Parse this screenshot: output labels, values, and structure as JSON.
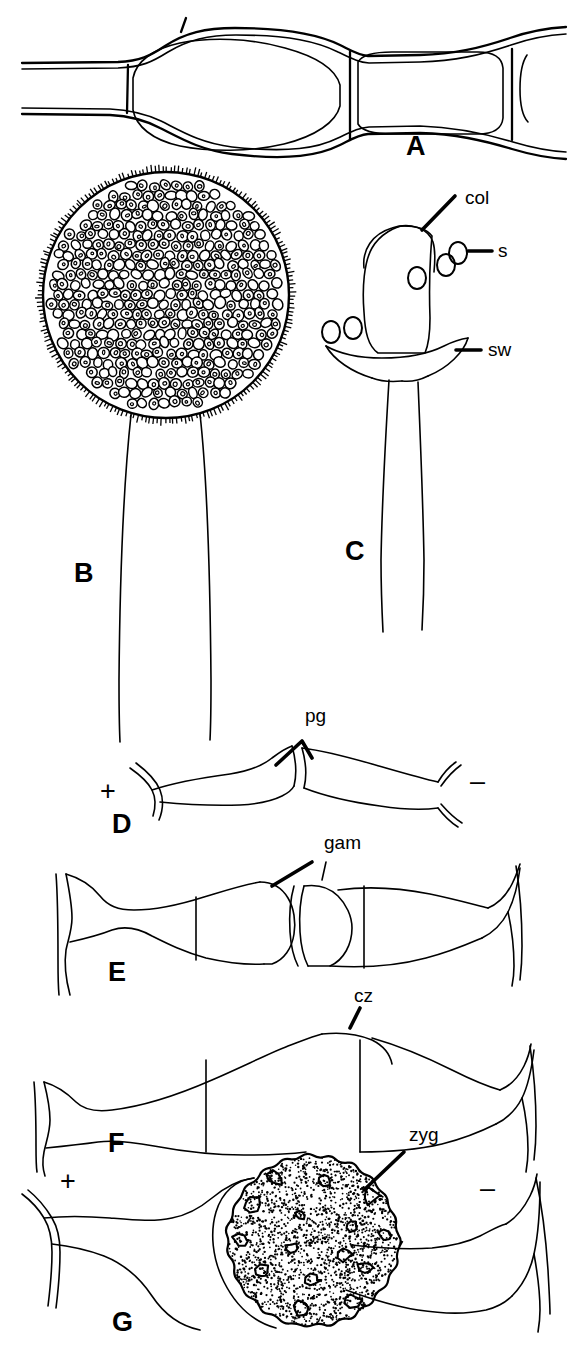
{
  "figure": {
    "background_color": "#ffffff",
    "ink_color": "#000000",
    "width": 576,
    "height": 1359
  },
  "panels": [
    {
      "id": "A",
      "letter": "A",
      "name": "hypha-with-septa",
      "letter_x": 406,
      "letter_y": 155,
      "caption_icon": "hypha-icon"
    },
    {
      "id": "B",
      "letter": "B",
      "name": "sporangium-with-spores",
      "letter_x": 74,
      "letter_y": 582,
      "caption_icon": "sporangium-icon"
    },
    {
      "id": "C",
      "letter": "C",
      "name": "columella-after-spore-release",
      "letter_x": 345,
      "letter_y": 560,
      "caption_icon": "columella-icon"
    },
    {
      "id": "D",
      "letter": "D",
      "name": "progametangia-stage",
      "letter_x": 112,
      "letter_y": 833,
      "caption_icon": "progametangia-icon"
    },
    {
      "id": "E",
      "letter": "E",
      "name": "gametangia-stage",
      "letter_x": 108,
      "letter_y": 981,
      "caption_icon": "gametangia-icon"
    },
    {
      "id": "F",
      "letter": "F",
      "name": "coenozygote-stage",
      "letter_x": 108,
      "letter_y": 1152,
      "caption_icon": "coenozygote-icon"
    },
    {
      "id": "G",
      "letter": "G",
      "name": "zygospore-stage",
      "letter_x": 112,
      "letter_y": 1331,
      "caption_icon": "zygospore-icon"
    }
  ],
  "structure_labels": [
    {
      "id": "col",
      "text": "col",
      "name": "columella-label",
      "x": 465,
      "y": 204,
      "panel": "C"
    },
    {
      "id": "s",
      "text": "s",
      "name": "spore-label",
      "x": 498,
      "y": 257,
      "panel": "C"
    },
    {
      "id": "sw",
      "text": "sw",
      "name": "sporangial-wall-label",
      "x": 488,
      "y": 356,
      "panel": "C"
    },
    {
      "id": "pg",
      "text": "pg",
      "name": "progametangium-label",
      "x": 305,
      "y": 722,
      "panel": "D"
    },
    {
      "id": "gam",
      "text": "gam",
      "name": "gametangium-label",
      "x": 324,
      "y": 849,
      "panel": "E"
    },
    {
      "id": "cz",
      "text": "cz",
      "name": "coenozygote-label",
      "x": 354,
      "y": 1002,
      "panel": "F"
    },
    {
      "id": "zyg",
      "text": "zyg",
      "name": "zygospore-label",
      "x": 409,
      "y": 1141,
      "panel": "G"
    }
  ],
  "mating_signs": [
    {
      "id": "d-plus",
      "text": "+",
      "name": "plus-mating-type-sign",
      "x": 100,
      "y": 800,
      "panel": "D"
    },
    {
      "id": "d-minus",
      "text": "–",
      "name": "minus-mating-type-sign",
      "x": 470,
      "y": 790,
      "panel": "D"
    },
    {
      "id": "g-plus",
      "text": "+",
      "name": "plus-mating-type-sign",
      "x": 60,
      "y": 1190,
      "panel": "G"
    },
    {
      "id": "g-minus",
      "text": "–",
      "name": "minus-mating-type-sign",
      "x": 480,
      "y": 1197,
      "panel": "G"
    }
  ],
  "unlabeled_marks": [
    {
      "id": "tick-a",
      "name": "septum-pointer-tick",
      "x": 183,
      "y": 24,
      "panel": "A"
    }
  ]
}
